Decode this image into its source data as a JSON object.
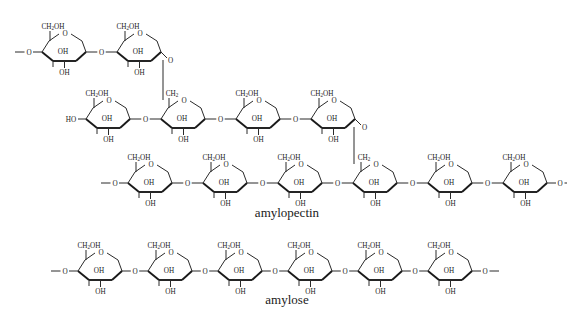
{
  "figure": {
    "title": "",
    "background_color": "#ffffff",
    "line_color": "#2b2b2b",
    "bold_edge_color": "#1a1a1a",
    "text_color": "#1a1a1a",
    "captions": [
      {
        "text": "amylopectin",
        "x": 287,
        "y": 216
      },
      {
        "text": "amylose",
        "x": 287,
        "y": 303
      }
    ],
    "labels": {
      "ch2oh": "CH",
      "ch2oh_sub": "2",
      "ch2oh_tail": "OH",
      "ch2": "CH",
      "ch2_sub": "2",
      "oh": "OH",
      "ho": "HO",
      "o": "O"
    },
    "structures": [
      {
        "name": "amylopectin-branch-upper",
        "row": 1,
        "ring_count": 2,
        "baseline_y": 52,
        "first_ring_x": 42,
        "ring_spacing": 75,
        "left_terminus": "O-stub",
        "right_terminus": "branch-down",
        "rings": [
          {
            "index": 0,
            "top_label": "CH2OH",
            "c2_label": "OH",
            "c3_label": "OH",
            "ring_o": "O"
          },
          {
            "index": 1,
            "top_label": "CH2OH",
            "c2_label": "OH",
            "c3_label": "OH",
            "ring_o": "O"
          }
        ]
      },
      {
        "name": "amylopectin-branch-middle",
        "row": 2,
        "ring_count": 4,
        "baseline_y": 119,
        "first_ring_x": 86,
        "ring_spacing": 75,
        "left_terminus": "HO",
        "right_terminus": "branch-down",
        "rings": [
          {
            "index": 0,
            "top_label": "CH2OH",
            "c2_label": "OH",
            "c3_label": "OH",
            "ring_o": "O"
          },
          {
            "index": 1,
            "top_label": "CH2",
            "c2_label": "OH",
            "c3_label": "OH",
            "ring_o": "O"
          },
          {
            "index": 2,
            "top_label": "CH2OH",
            "c2_label": "OH",
            "c3_label": "OH",
            "ring_o": "O"
          },
          {
            "index": 3,
            "top_label": "CH2OH",
            "c2_label": "OH",
            "c3_label": "OH",
            "ring_o": "O"
          }
        ]
      },
      {
        "name": "amylopectin-main-chain",
        "row": 3,
        "ring_count": 6,
        "baseline_y": 183,
        "first_ring_x": 128,
        "ring_spacing": 75,
        "left_terminus": "O-stub",
        "right_terminus": "O-stub",
        "rings": [
          {
            "index": 0,
            "top_label": "CH2OH",
            "c2_label": "OH",
            "c3_label": "OH",
            "ring_o": "O"
          },
          {
            "index": 1,
            "top_label": "CH2OH",
            "c2_label": "OH",
            "c3_label": "OH",
            "ring_o": "O"
          },
          {
            "index": 2,
            "top_label": "CH2OH",
            "c2_label": "OH",
            "c3_label": "OH",
            "ring_o": "O"
          },
          {
            "index": 3,
            "top_label": "CH2",
            "c2_label": "OH",
            "c3_label": "OH",
            "ring_o": "O"
          },
          {
            "index": 4,
            "top_label": "CH2OH",
            "c2_label": "OH",
            "c3_label": "OH",
            "ring_o": "O"
          },
          {
            "index": 5,
            "top_label": "CH2OH",
            "c2_label": "OH",
            "c3_label": "OH",
            "ring_o": "O"
          }
        ]
      },
      {
        "name": "amylose-chain",
        "row": 4,
        "ring_count": 6,
        "baseline_y": 271,
        "first_ring_x": 78,
        "ring_spacing": 70,
        "left_terminus": "O-stub",
        "right_terminus": "O-stub",
        "rings": [
          {
            "index": 0,
            "top_label": "CH2OH",
            "c2_label": "OH",
            "c3_label": "OH",
            "ring_o": "O"
          },
          {
            "index": 1,
            "top_label": "CH2OH",
            "c2_label": "OH",
            "c3_label": "OH",
            "ring_o": "O"
          },
          {
            "index": 2,
            "top_label": "CH2OH",
            "c2_label": "OH",
            "c3_label": "OH",
            "ring_o": "O"
          },
          {
            "index": 3,
            "top_label": "CH2OH",
            "c2_label": "OH",
            "c3_label": "OH",
            "ring_o": "O"
          },
          {
            "index": 4,
            "top_label": "CH2OH",
            "c2_label": "OH",
            "c3_label": "OH",
            "ring_o": "O"
          },
          {
            "index": 5,
            "top_label": "CH2OH",
            "c2_label": "OH",
            "c3_label": "OH",
            "ring_o": "O"
          }
        ]
      }
    ],
    "branch_links": [
      {
        "name": "branch-link-upper",
        "from_row": 1,
        "from_ring": 1,
        "to_row": 2,
        "to_ring": 1,
        "x": 163,
        "y1": 60,
        "y2": 100
      },
      {
        "name": "branch-link-lower",
        "from_row": 2,
        "from_ring": 3,
        "to_row": 3,
        "to_ring": 3,
        "x": 354,
        "y1": 127,
        "y2": 164
      }
    ]
  }
}
